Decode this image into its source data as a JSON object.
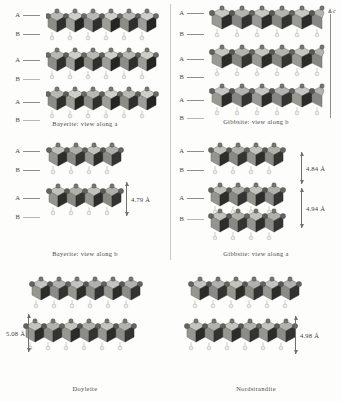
{
  "figure": {
    "axis_indicator": {
      "label": "c",
      "name": "c-axis-arrow"
    },
    "panels": [
      {
        "id": "bayerite-a",
        "caption": "Bayerite: view along a",
        "layer_labels": [
          "A",
          "B",
          "A",
          "B",
          "A",
          "B"
        ],
        "sheet_count": 3,
        "dimension": null
      },
      {
        "id": "gibbsite-b",
        "caption": "Gibbsite: view along b",
        "layer_labels": [
          "A",
          "B",
          "A",
          "B",
          "A",
          "B"
        ],
        "sheet_count": 3,
        "dimension": null
      },
      {
        "id": "bayerite-b",
        "caption": "Bayerite: view along b",
        "layer_labels": [
          "A",
          "B",
          "A",
          "B"
        ],
        "sheet_count": 2,
        "dimension": {
          "value": "4.79 Å",
          "side": "right"
        }
      },
      {
        "id": "gibbsite-a",
        "caption": "Gibbsite: view along a",
        "layer_labels": [
          "A",
          "B",
          "A",
          "B"
        ],
        "sheet_count": 2,
        "dimensions": [
          {
            "value": "4.84 Å",
            "side": "right"
          },
          {
            "value": "4.94 Å",
            "side": "right"
          }
        ]
      },
      {
        "id": "doyleite",
        "caption": "Doyleite",
        "layer_labels": [],
        "sheet_count": 2,
        "dimension": {
          "value": "5.08 Å",
          "side": "left"
        }
      },
      {
        "id": "nordstrandite",
        "caption": "Nordstrandite",
        "layer_labels": [],
        "sheet_count": 2,
        "dimension": {
          "value": "4.98 Å",
          "side": "right"
        }
      }
    ],
    "colors": {
      "background": "#fdfdfc",
      "polyhedron_light": "#c9c9c4",
      "polyhedron_mid": "#9a9a95",
      "polyhedron_dark": "#2e2e2c",
      "atom_dark": "#5a5a56",
      "atom_light": "#e8e8e4",
      "rule": "#c8c8c4",
      "text": "#3a3a38"
    }
  }
}
